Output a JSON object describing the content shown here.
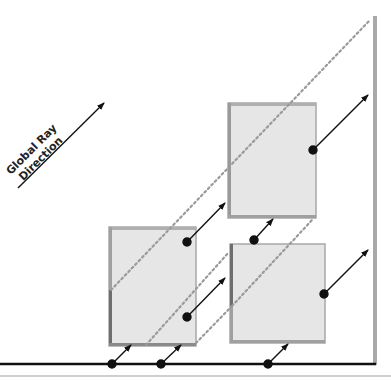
{
  "diagram": {
    "label_line1": "Global Ray",
    "label_line2": "Direction",
    "colors": {
      "box_fill": "#e6e6e6",
      "box_edge": "#a8a8a8",
      "box_shadow_edge": "#6e6e6e",
      "dotted_line": "#9a9a9a",
      "arrow": "#111111",
      "baseline": "#111111",
      "wall": "#a9a9a9",
      "bottom_rule": "#cfcfcf"
    },
    "boxes": [
      {
        "id": "left-box",
        "x": 109,
        "y": 227,
        "w": 87,
        "h": 119
      },
      {
        "id": "upper-right-box",
        "x": 228,
        "y": 103,
        "w": 88,
        "h": 115
      },
      {
        "id": "lower-right-box",
        "x": 230,
        "y": 244,
        "w": 95,
        "h": 99
      }
    ],
    "arrows": [
      {
        "id": "global-ray-arrow",
        "x1": 18,
        "y1": 188,
        "x2": 104,
        "y2": 103,
        "dot": false
      },
      {
        "id": "ray-baseline-1",
        "x1": 112,
        "y1": 364,
        "x2": 131,
        "y2": 345,
        "dot": true
      },
      {
        "id": "ray-baseline-2",
        "x1": 161,
        "y1": 364,
        "x2": 181,
        "y2": 345,
        "dot": true
      },
      {
        "id": "ray-baseline-3",
        "x1": 268,
        "y1": 364,
        "x2": 288,
        "y2": 344,
        "dot": true
      },
      {
        "id": "ray-left-box-top",
        "x1": 187,
        "y1": 242,
        "x2": 225,
        "y2": 203,
        "dot": true
      },
      {
        "id": "ray-left-box-bottom",
        "x1": 187,
        "y1": 317,
        "x2": 225,
        "y2": 278,
        "dot": true
      },
      {
        "id": "ray-between-right-boxes",
        "x1": 254,
        "y1": 240,
        "x2": 273,
        "y2": 219,
        "dot": true
      },
      {
        "id": "ray-upper-right-box",
        "x1": 313,
        "y1": 150,
        "x2": 368,
        "y2": 95,
        "dot": true
      },
      {
        "id": "ray-lower-right-box",
        "x1": 324,
        "y1": 294,
        "x2": 368,
        "y2": 250,
        "dot": true
      }
    ],
    "dotted_lines": [
      {
        "id": "occluded-ray-1",
        "x1": 111,
        "y1": 290,
        "x2": 370,
        "y2": 20
      },
      {
        "id": "occluded-ray-2",
        "x1": 146,
        "y1": 345,
        "x2": 229,
        "y2": 252
      },
      {
        "id": "occluded-ray-3",
        "x1": 196,
        "y1": 343,
        "x2": 232,
        "y2": 306
      },
      {
        "id": "occluded-ray-4",
        "x1": 232,
        "y1": 306,
        "x2": 313,
        "y2": 219
      }
    ],
    "baseline": {
      "x1": 0,
      "y1": 364,
      "x2": 376,
      "y2": 364
    },
    "wall": {
      "x": 375,
      "y1": 16,
      "y2": 365
    },
    "bottom_rule": {
      "x1": 0,
      "y1": 376,
      "x2": 391,
      "y2": 376
    }
  }
}
